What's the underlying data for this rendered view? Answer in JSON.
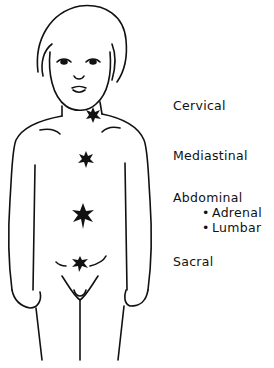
{
  "diagram": {
    "marker_color": "#111111",
    "sites": [
      {
        "label": "Cervical",
        "marker": {
          "x": 93,
          "y": 115
        }
      },
      {
        "label": "Mediastinal",
        "marker": {
          "x": 86,
          "y": 160
        }
      },
      {
        "label": "Abdominal",
        "marker": {
          "x": 83,
          "y": 216
        },
        "subsites": [
          "Adrenal",
          "Lumbar"
        ]
      },
      {
        "label": "Sacral",
        "marker": {
          "x": 80,
          "y": 264
        }
      }
    ],
    "bullet_glyph": "•"
  }
}
